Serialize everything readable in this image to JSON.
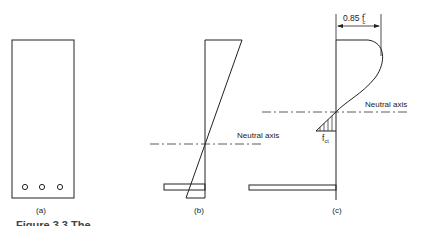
{
  "figure": {
    "panels": [
      {
        "id": "a",
        "label": "(a)",
        "title": "beam-cross-section"
      },
      {
        "id": "b",
        "label": "(b)",
        "title": "linear-strain-distribution"
      },
      {
        "id": "c",
        "label": "(c)",
        "title": "stress-distribution"
      }
    ],
    "annotations": {
      "neutral_axis_b": "Neutral axis",
      "neutral_axis_c": "Neutral axis",
      "peak_stress_main": "0.85 f",
      "peak_stress_sup": "′",
      "peak_stress_sub": "c",
      "tension_stress_main": "f",
      "tension_stress_sub": "ct"
    },
    "caption": "Figure 3.3   The …"
  }
}
